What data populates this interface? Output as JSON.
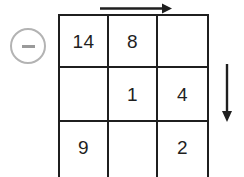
{
  "puzzle": {
    "operator": {
      "symbol": "−",
      "name": "minus",
      "circle_color": "#b3b3b3",
      "glyph_color": "#9a9a9a"
    },
    "grid": {
      "rows": 3,
      "columns": 3,
      "line_color": "#1f1f1f",
      "cells": [
        [
          "14",
          "8",
          ""
        ],
        [
          "",
          "1",
          "4"
        ],
        [
          "9",
          "",
          "2"
        ]
      ],
      "flat_values": {
        "r1c1": "14",
        "r1c2": "8",
        "r1c3": "",
        "r2c1": "",
        "r2c2": "1",
        "r2c3": "4",
        "r3c1": "9",
        "r3c2": "",
        "r3c3": "2"
      }
    },
    "arrows": [
      {
        "name": "arrow-right",
        "direction": "right",
        "color": "#1f1f1f"
      },
      {
        "name": "arrow-down",
        "direction": "down",
        "color": "#1f1f1f"
      }
    ]
  }
}
